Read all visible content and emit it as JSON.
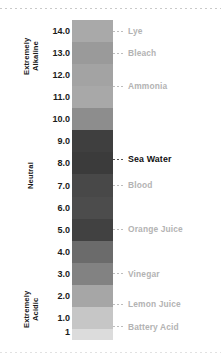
{
  "chart_data": {
    "type": "bar",
    "xlabel": "",
    "ylabel": "pH",
    "orientation": "vertical",
    "grid": false,
    "legend": "none",
    "ylim": [
      1,
      14.5
    ],
    "axis_ticks": [
      {
        "label": "14.0",
        "value": 14
      },
      {
        "label": "13.0",
        "value": 13
      },
      {
        "label": "12.0",
        "value": 12
      },
      {
        "label": "11.0",
        "value": 11
      },
      {
        "label": "10.0",
        "value": 10
      },
      {
        "label": "9.0",
        "value": 9
      },
      {
        "label": "8.0",
        "value": 8
      },
      {
        "label": "7.0",
        "value": 7
      },
      {
        "label": "6.0",
        "value": 6
      },
      {
        "label": "5.0",
        "value": 5
      },
      {
        "label": "4.0",
        "value": 4
      },
      {
        "label": "3.0",
        "value": 3
      },
      {
        "label": "2.0",
        "value": 2
      },
      {
        "label": "1.0",
        "value": 1
      },
      {
        "label": "1",
        "value": 0.35
      }
    ],
    "bands": [
      {
        "ph": 14,
        "color": "#a9a9a9"
      },
      {
        "ph": 13,
        "color": "#9a9a9a"
      },
      {
        "ph": 12,
        "color": "#a3a3a3"
      },
      {
        "ph": 11,
        "color": "#a8a8a8"
      },
      {
        "ph": 10,
        "color": "#8d8d8d"
      },
      {
        "ph": 9,
        "color": "#3f3f3f"
      },
      {
        "ph": 8,
        "color": "#3b3b3b"
      },
      {
        "ph": 7,
        "color": "#484848"
      },
      {
        "ph": 6,
        "color": "#4c4c4c"
      },
      {
        "ph": 5,
        "color": "#414141"
      },
      {
        "ph": 4,
        "color": "#6b6b6b"
      },
      {
        "ph": 3,
        "color": "#828282"
      },
      {
        "ph": 2,
        "color": "#a6a6a6"
      },
      {
        "ph": 1,
        "color": "#c6c6c6"
      },
      {
        "ph": 0,
        "color": "#dcdcdc"
      }
    ],
    "substances": [
      {
        "name": "Lye",
        "ph": 14.0,
        "highlight": false
      },
      {
        "name": "Bleach",
        "ph": 13.0,
        "highlight": false
      },
      {
        "name": "Ammonia",
        "ph": 11.5,
        "highlight": false
      },
      {
        "name": "Sea Water",
        "ph": 8.2,
        "highlight": true
      },
      {
        "name": "Blood",
        "ph": 7.0,
        "highlight": false
      },
      {
        "name": "Orange Juice",
        "ph": 5.0,
        "highlight": false
      },
      {
        "name": "Vinegar",
        "ph": 3.0,
        "highlight": false
      },
      {
        "name": "Lemon Juice",
        "ph": 1.6,
        "highlight": false
      },
      {
        "name": "Battery Acid",
        "ph": 0.6,
        "highlight": false
      }
    ],
    "zones": [
      {
        "label": "Extremely\nAlkaline",
        "key": "alkaline"
      },
      {
        "label": "Neutral",
        "key": "neutral"
      },
      {
        "label": "Extremely\nAcidic",
        "key": "acidic"
      }
    ],
    "colors": {
      "highlight_text": "#111111",
      "muted_text": "#b3b3b3",
      "axis_text": "#1b1b1b",
      "rule": "#c9c9c9"
    }
  }
}
